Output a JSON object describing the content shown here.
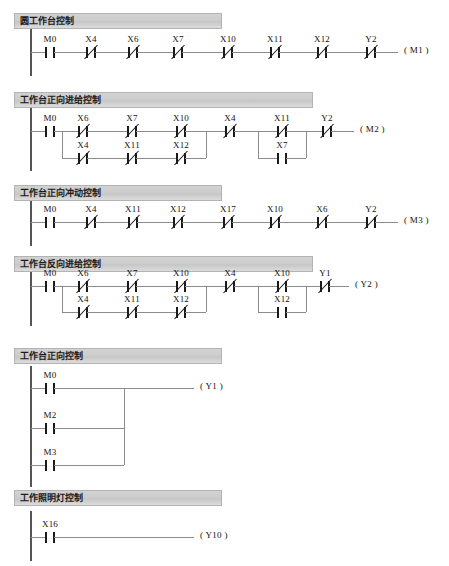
{
  "document": {
    "title": "PLC 梯形图程序",
    "type": "ladder-logic-diagram",
    "rail_color": "#555555",
    "wire_color": "#8c8c8c",
    "contact_color": "#1a1a1a",
    "header_bg": "#cdcdcd"
  },
  "sections": [
    {
      "id": "s1",
      "title": "圆工作台控制",
      "header": {
        "x": 14,
        "y": 13,
        "width": 208,
        "height": 16
      },
      "rung": {
        "y": 52,
        "left_rail_x": 31,
        "right_end_x": 400
      },
      "elements": [
        {
          "name": "M0",
          "type": "NO",
          "x": 50
        },
        {
          "name": "X4",
          "type": "NC",
          "x": 91
        },
        {
          "name": "X6",
          "type": "NC",
          "x": 133
        },
        {
          "name": "X7",
          "type": "NC",
          "x": 178
        },
        {
          "name": "X10",
          "type": "NC",
          "x": 228
        },
        {
          "name": "X11",
          "type": "NC",
          "x": 275
        },
        {
          "name": "X12",
          "type": "NC",
          "x": 322
        },
        {
          "name": "Y2",
          "type": "NC",
          "x": 371
        }
      ],
      "coil": {
        "name": "M1",
        "x": 404
      }
    },
    {
      "id": "s2",
      "title": "工作台正向进给控制",
      "header": {
        "x": 14,
        "y": 92,
        "width": 299,
        "height": 16
      },
      "rung": {
        "y": 131,
        "left_rail_x": 31,
        "right_end_x": 355
      },
      "elements": [
        {
          "name": "M0",
          "type": "NO",
          "x": 50
        }
      ],
      "branches": [
        {
          "start_x": 62,
          "end_x": 206,
          "sub_y": 158,
          "top": [
            {
              "name": "X6",
              "type": "NC",
              "x": 83
            },
            {
              "name": "X7",
              "type": "NC",
              "x": 132
            },
            {
              "name": "X10",
              "type": "NC",
              "x": 181
            }
          ],
          "bottom": [
            {
              "name": "X4",
              "type": "NC",
              "x": 83
            },
            {
              "name": "X11",
              "type": "NC",
              "x": 132
            },
            {
              "name": "X12",
              "type": "NC",
              "x": 181
            }
          ]
        },
        {
          "start_x": 258,
          "end_x": 306,
          "sub_y": 158,
          "top": [
            {
              "name": "X11",
              "type": "NC",
              "x": 282
            }
          ],
          "bottom": [
            {
              "name": "X7",
              "type": "NO",
              "x": 282
            }
          ]
        }
      ],
      "mid_elements": [
        {
          "name": "X4",
          "type": "NC",
          "x": 230
        },
        {
          "name": "Y2",
          "type": "NC",
          "x": 327
        }
      ],
      "coil": {
        "name": "M2",
        "x": 360
      }
    },
    {
      "id": "s3",
      "title": "工作台正向冲动控制",
      "header": {
        "x": 14,
        "y": 185,
        "width": 208,
        "height": 16
      },
      "rung": {
        "y": 222,
        "left_rail_x": 31,
        "right_end_x": 400
      },
      "elements": [
        {
          "name": "M0",
          "type": "NO",
          "x": 50
        },
        {
          "name": "X4",
          "type": "NC",
          "x": 91
        },
        {
          "name": "X11",
          "type": "NC",
          "x": 133
        },
        {
          "name": "X12",
          "type": "NC",
          "x": 178
        },
        {
          "name": "X17",
          "type": "NC",
          "x": 228
        },
        {
          "name": "X10",
          "type": "NC",
          "x": 275
        },
        {
          "name": "X6",
          "type": "NC",
          "x": 322
        },
        {
          "name": "Y2",
          "type": "NC",
          "x": 371
        }
      ],
      "coil": {
        "name": "M3",
        "x": 404
      }
    },
    {
      "id": "s4",
      "title": "工作台反向进给控制",
      "header": {
        "x": 14,
        "y": 256,
        "width": 299,
        "height": 16
      },
      "rung": {
        "y": 286,
        "left_rail_x": 31,
        "right_end_x": 348
      },
      "elements": [
        {
          "name": "M0",
          "type": "NO",
          "x": 50
        }
      ],
      "branches": [
        {
          "start_x": 62,
          "end_x": 206,
          "sub_y": 312,
          "top": [
            {
              "name": "X6",
              "type": "NC",
              "x": 83
            },
            {
              "name": "X7",
              "type": "NC",
              "x": 132
            },
            {
              "name": "X10",
              "type": "NC",
              "x": 181
            }
          ],
          "bottom": [
            {
              "name": "X4",
              "type": "NC",
              "x": 83
            },
            {
              "name": "X11",
              "type": "NC",
              "x": 132
            },
            {
              "name": "X12",
              "type": "NC",
              "x": 181
            }
          ]
        },
        {
          "start_x": 258,
          "end_x": 306,
          "sub_y": 312,
          "top": [
            {
              "name": "X10",
              "type": "NC",
              "x": 282
            }
          ],
          "bottom": [
            {
              "name": "X12",
              "type": "NO",
              "x": 282
            }
          ]
        }
      ],
      "mid_elements": [
        {
          "name": "X4",
          "type": "NC",
          "x": 230
        },
        {
          "name": "Y1",
          "type": "NC",
          "x": 325
        }
      ],
      "coil": {
        "name": "Y2",
        "x": 355
      }
    },
    {
      "id": "s5",
      "title": "工作台正向控制",
      "header": {
        "x": 14,
        "y": 348,
        "width": 208,
        "height": 16
      },
      "rung": {
        "y": 388,
        "left_rail_x": 31,
        "right_end_x": 196
      },
      "parallel_rungs": [
        {
          "name": "M0",
          "type": "NO",
          "x": 50,
          "y": 388
        },
        {
          "name": "M2",
          "type": "NO",
          "x": 50,
          "y": 428
        },
        {
          "name": "M3",
          "type": "NO",
          "x": 50,
          "y": 465
        }
      ],
      "join_x": 124,
      "coil": {
        "name": "Y1",
        "x": 200
      }
    },
    {
      "id": "s6",
      "title": "工作照明灯控制",
      "header": {
        "x": 14,
        "y": 490,
        "width": 208,
        "height": 16
      },
      "rung": {
        "y": 537,
        "left_rail_x": 31,
        "right_end_x": 197
      },
      "elements": [
        {
          "name": "X16",
          "type": "NO",
          "x": 50
        }
      ],
      "coil": {
        "name": "Y10",
        "x": 200
      }
    }
  ],
  "legend": {
    "no_contact": "常开触点",
    "nc_contact": "常闭触点",
    "coil": "输出线圈"
  }
}
